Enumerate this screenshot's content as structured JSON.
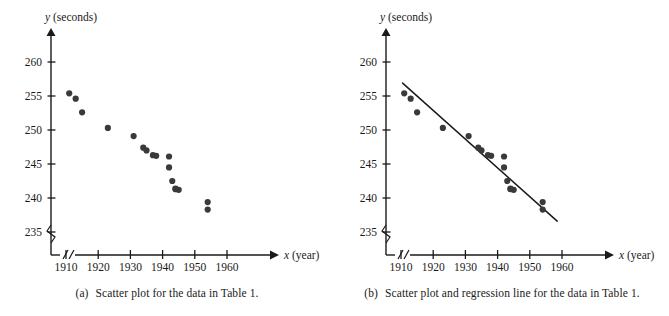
{
  "figure": {
    "panels": [
      {
        "id": "a",
        "tag": "(a)",
        "caption": "Scatter plot for the data in Table 1.",
        "show_regression": false
      },
      {
        "id": "b",
        "tag": "(b)",
        "caption": "Scatter plot and regression line for the data in Table 1.",
        "show_regression": true
      }
    ],
    "point_color": "#3a3a3a",
    "axis_color": "#1a1a1a",
    "line_color": "#1a1a1a"
  },
  "chart_data": {
    "type": "scatter",
    "title": "",
    "xlabel": "x (year)",
    "ylabel": "y (seconds)",
    "xlabel_var": "x",
    "xlabel_unit": "(year)",
    "ylabel_var": "y",
    "ylabel_unit": "(seconds)",
    "xlim": [
      1905,
      1965
    ],
    "ylim": [
      233,
      262
    ],
    "xticks": [
      1910,
      1920,
      1930,
      1940,
      1950,
      1960
    ],
    "yticks": [
      235,
      240,
      245,
      250,
      255,
      260
    ],
    "xtick_labels": [
      "1910",
      "1920",
      "1930",
      "1940",
      "1950",
      "1960"
    ],
    "ytick_labels": [
      "235",
      "240",
      "245",
      "250",
      "255",
      "260"
    ],
    "axis_break_x": true,
    "axis_break_y": true,
    "grid": false,
    "legend": "none",
    "x": [
      1911,
      1913,
      1915,
      1923,
      1931,
      1934,
      1935,
      1937,
      1938,
      1942,
      1942,
      1943,
      1944,
      1944,
      1945,
      1954,
      1954
    ],
    "y": [
      255.4,
      254.6,
      252.6,
      250.3,
      249.1,
      247.4,
      247.0,
      246.3,
      246.2,
      246.1,
      244.5,
      242.5,
      241.4,
      241.3,
      241.2,
      239.4,
      238.3
    ],
    "points": [
      {
        "x": 1911,
        "y": 255.4
      },
      {
        "x": 1913,
        "y": 254.6
      },
      {
        "x": 1915,
        "y": 252.6
      },
      {
        "x": 1923,
        "y": 250.3
      },
      {
        "x": 1931,
        "y": 249.1
      },
      {
        "x": 1934,
        "y": 247.4
      },
      {
        "x": 1935,
        "y": 247.0
      },
      {
        "x": 1937,
        "y": 246.3
      },
      {
        "x": 1938,
        "y": 246.2
      },
      {
        "x": 1942,
        "y": 246.1
      },
      {
        "x": 1942,
        "y": 244.5
      },
      {
        "x": 1943,
        "y": 242.5
      },
      {
        "x": 1944,
        "y": 241.4
      },
      {
        "x": 1944,
        "y": 241.3
      },
      {
        "x": 1945,
        "y": 241.2
      },
      {
        "x": 1954,
        "y": 239.4
      },
      {
        "x": 1954,
        "y": 238.3
      }
    ],
    "regression_line": {
      "x_start": 1910.5,
      "y_start": 256.9,
      "x_end": 1958.5,
      "y_end": 236.6
    }
  }
}
